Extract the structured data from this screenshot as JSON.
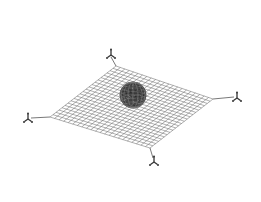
{
  "diagram": {
    "type": "net-with-sphere",
    "background": "#ffffff",
    "net": {
      "corners": {
        "top": [
          116,
          66
        ],
        "right": [
          213,
          99
        ],
        "bottom": [
          150,
          148
        ],
        "left": [
          50,
          117
        ]
      },
      "divisions": 22,
      "line_color": "#6e6e6e",
      "line_width": 0.55
    },
    "sphere": {
      "center": [
        133,
        95
      ],
      "radius": 13,
      "fill": "#3a3a3a",
      "speckle_color": "#8a8a8a"
    },
    "tethers": [
      {
        "name": "top",
        "from": [
          116,
          66
        ],
        "to": [
          111,
          57
        ]
      },
      {
        "name": "right",
        "from": [
          213,
          99
        ],
        "to": [
          234,
          97
        ]
      },
      {
        "name": "bottom",
        "from": [
          150,
          148
        ],
        "to": [
          153,
          158
        ]
      },
      {
        "name": "left",
        "from": [
          50,
          117
        ],
        "to": [
          31,
          118
        ]
      }
    ],
    "anchors": [
      {
        "name": "top",
        "pos": [
          111,
          54
        ]
      },
      {
        "name": "right",
        "pos": [
          237,
          97
        ]
      },
      {
        "name": "bottom",
        "pos": [
          154,
          161
        ]
      },
      {
        "name": "left",
        "pos": [
          28,
          118
        ]
      }
    ],
    "ink_color": "#333333"
  }
}
